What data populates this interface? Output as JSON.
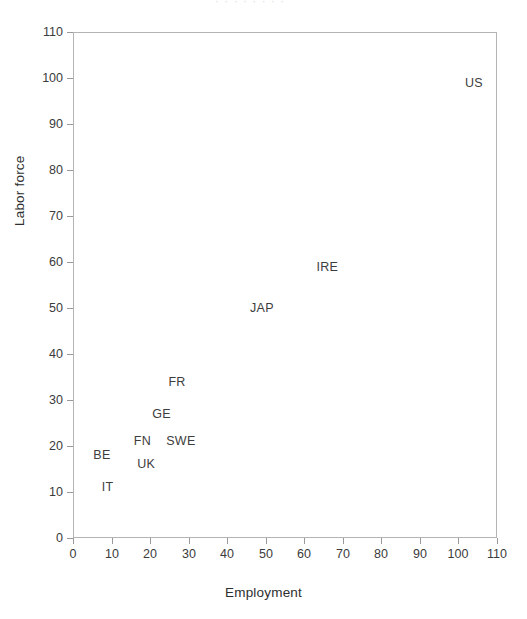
{
  "figure": {
    "title_remnant": "·  ·   ·   ·  ·    ·   ·  ·"
  },
  "chart_data": {
    "type": "scatter",
    "title": "",
    "xlabel": "Employment",
    "ylabel": "Labor force",
    "xlim": [
      0,
      110
    ],
    "ylim": [
      0,
      110
    ],
    "xticks": [
      0,
      10,
      20,
      30,
      40,
      50,
      60,
      70,
      80,
      90,
      100,
      110
    ],
    "yticks": [
      0,
      10,
      20,
      30,
      40,
      50,
      60,
      70,
      80,
      90,
      100,
      110
    ],
    "grid": false,
    "legend": null,
    "marker_style": "text-label",
    "point_color": "#3d3d3d",
    "frame_color": "#b4b4b4",
    "labels": [
      "BE",
      "IT",
      "UK",
      "FN",
      "GE",
      "SWE",
      "FR",
      "JAP",
      "IRE",
      "US"
    ],
    "x": [
      7.5,
      9,
      19,
      18,
      23,
      28,
      27,
      49,
      66,
      104
    ],
    "y": [
      18,
      11,
      16,
      21,
      27,
      21,
      34,
      50,
      59,
      99
    ],
    "points": [
      {
        "label": "BE",
        "x": 7.5,
        "y": 18
      },
      {
        "label": "IT",
        "x": 9,
        "y": 11
      },
      {
        "label": "UK",
        "x": 19,
        "y": 16
      },
      {
        "label": "FN",
        "x": 18,
        "y": 21
      },
      {
        "label": "GE",
        "x": 23,
        "y": 27
      },
      {
        "label": "SWE",
        "x": 28,
        "y": 21
      },
      {
        "label": "FR",
        "x": 27,
        "y": 34
      },
      {
        "label": "JAP",
        "x": 49,
        "y": 50
      },
      {
        "label": "IRE",
        "x": 66,
        "y": 59
      },
      {
        "label": "US",
        "x": 104,
        "y": 99
      }
    ]
  }
}
